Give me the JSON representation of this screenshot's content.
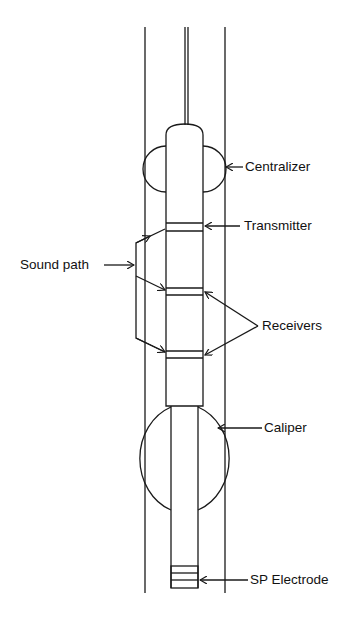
{
  "diagram": {
    "type": "borehole sonic logging tool schematic",
    "labels": {
      "centralizer": "Centralizer",
      "transmitter": "Transmitter",
      "sound_path": "Sound path",
      "receivers": "Receivers",
      "caliper": "Caliper",
      "sp_electrode": "SP Electrode"
    },
    "colors": {
      "line": "#1a1a1a",
      "background": "#ffffff"
    }
  }
}
